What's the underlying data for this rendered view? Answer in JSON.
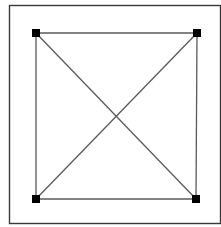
{
  "diagram": {
    "type": "complete-graph-k4",
    "frame": {
      "x": 9.5,
      "y": 5.5,
      "width": 211,
      "height": 218,
      "stroke": "#3a3a3a"
    },
    "node_size": 8,
    "node_color": "#000000",
    "edge_color": "#5a5a5a",
    "nodes": [
      {
        "id": "top-left",
        "x": 36,
        "y": 33
      },
      {
        "id": "top-right",
        "x": 197,
        "y": 33
      },
      {
        "id": "bottom-left",
        "x": 36,
        "y": 199
      },
      {
        "id": "bottom-right",
        "x": 196,
        "y": 199
      }
    ],
    "edges": [
      {
        "from": "top-left",
        "to": "top-right"
      },
      {
        "from": "top-right",
        "to": "bottom-right"
      },
      {
        "from": "bottom-right",
        "to": "bottom-left"
      },
      {
        "from": "bottom-left",
        "to": "top-left"
      },
      {
        "from": "top-left",
        "to": "bottom-right"
      },
      {
        "from": "top-right",
        "to": "bottom-left"
      }
    ]
  }
}
